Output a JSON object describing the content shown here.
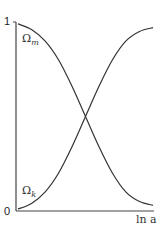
{
  "chart_data": {
    "type": "line",
    "title": "",
    "xlabel": "ln a",
    "ylabel": "",
    "y_ticks": [
      "0",
      "1"
    ],
    "ylim": [
      0,
      1
    ],
    "grid": false,
    "legend": "none (curves labeled inline)",
    "x": [
      0,
      0.1,
      0.2,
      0.3,
      0.4,
      0.5,
      0.6,
      0.7,
      0.8,
      0.9,
      1.0
    ],
    "series": [
      {
        "name": "Ωm",
        "label_base": "Ω",
        "label_sub": "m",
        "values": [
          0.99,
          0.96,
          0.9,
          0.8,
          0.66,
          0.5,
          0.34,
          0.2,
          0.1,
          0.05,
          0.03
        ]
      },
      {
        "name": "Ωk",
        "label_base": "Ω",
        "label_sub": "k",
        "values": [
          0.01,
          0.04,
          0.1,
          0.2,
          0.34,
          0.5,
          0.66,
          0.8,
          0.9,
          0.95,
          0.97
        ]
      }
    ],
    "annotations": [
      "Ωm",
      "Ωk"
    ]
  },
  "axes": {
    "y_top": "1",
    "y_bottom": "0",
    "x_label": "ln a"
  },
  "labels": {
    "omega_m": {
      "base": "Ω",
      "sub": "m"
    },
    "omega_k": {
      "base": "Ω",
      "sub": "k"
    }
  },
  "colors": {
    "curve": "#333333",
    "axis": "#444444"
  }
}
